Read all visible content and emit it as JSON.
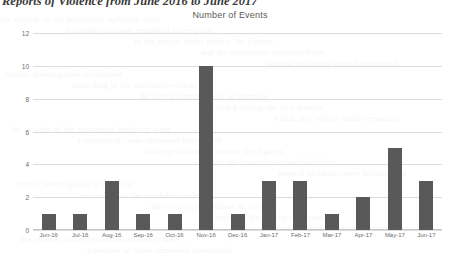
{
  "page": {
    "heading": "Reports of Violence from June 2016 to June 2017"
  },
  "chart_data": {
    "type": "bar",
    "title": "Number of Events",
    "xlabel": "",
    "ylabel": "",
    "categories": [
      "Jun-16",
      "Jul-16",
      "Aug-16",
      "Sep-16",
      "Oct-16",
      "Nov-16",
      "Dec-16",
      "Jan-17",
      "Feb-17",
      "Mar-17",
      "Apr-17",
      "May-17",
      "Jun-17"
    ],
    "values": [
      1,
      1,
      3,
      1,
      1,
      10,
      1,
      3,
      3,
      1,
      2,
      5,
      3
    ],
    "ylim": [
      0,
      12
    ],
    "yticks": [
      0,
      2,
      4,
      6,
      8,
      10,
      12
    ],
    "ytick_labels": [
      "0",
      "2",
      "4",
      "6",
      "8",
      "10",
      "12"
    ],
    "grid": true,
    "legend": "none",
    "bar_color": "#595959",
    "gridline_color": "#dcdcdc"
  },
  "bleed_text": {
    "lines": [
      "the records of the provincial authority were",
      "a number of cases remained unreported",
      "in the period under review the figures",
      "and the committee concluded that",
      "several incidents were documented",
      "further investigation is required",
      "according to the available evidence",
      "the overall trend shows an increase",
      "reported during the first quarter",
      "which may reflect under-reporting"
    ]
  }
}
